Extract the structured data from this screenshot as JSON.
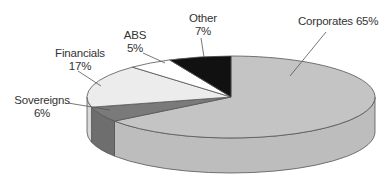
{
  "chart_data": {
    "type": "pie",
    "style": "3d",
    "title": "",
    "slices": [
      {
        "label": "Corporates",
        "value": 65,
        "display": "Corporates 65%",
        "color": "#c4c4c4",
        "side_color": "#bdbdbd"
      },
      {
        "label": "Sovereigns",
        "value": 6,
        "display": "6%",
        "color": "#7a7a7a",
        "side_color": "#6e6e6e"
      },
      {
        "label": "Financials",
        "value": 17,
        "display": "17%",
        "color": "#ececec",
        "side_color": "#d8d8d8"
      },
      {
        "label": "ABS",
        "value": 5,
        "display": "5%",
        "color": "#ffffff",
        "side_color": "#eeeeee"
      },
      {
        "label": "Other",
        "value": 7,
        "display": "7%",
        "color": "#111111",
        "side_color": "#111111"
      }
    ],
    "legend": "none",
    "start_angle_deg": 0,
    "direction": "clockwise"
  },
  "labels": {
    "corporates": {
      "name": "Corporates 65%"
    },
    "sovereigns": {
      "name": "Sovereigns",
      "pct": "6%"
    },
    "financials": {
      "name": "Financials",
      "pct": "17%"
    },
    "abs": {
      "name": "ABS",
      "pct": "5%"
    },
    "other": {
      "name": "Other",
      "pct": "7%"
    }
  }
}
